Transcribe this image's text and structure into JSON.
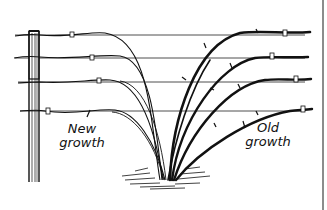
{
  "figure": {
    "type": "illustration",
    "colors": {
      "ink": "#111111",
      "background": "#ffffff",
      "border": "#555555"
    },
    "labels": [
      {
        "id": "new",
        "line1": "New",
        "line2": "growth"
      },
      {
        "id": "old",
        "line1": "Old",
        "line2": "growth"
      }
    ],
    "wires": 4,
    "posts": 1
  }
}
